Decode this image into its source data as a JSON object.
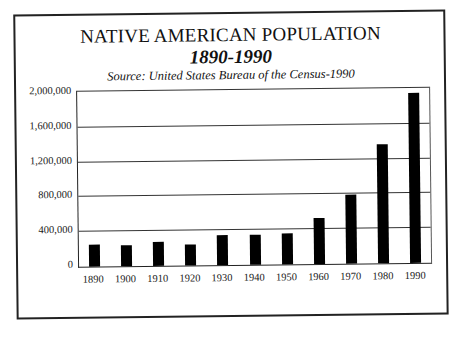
{
  "chart_data": {
    "type": "bar",
    "title": "NATIVE AMERICAN POPULATION",
    "subtitle": "1890-1990",
    "source": "Source: United States Bureau of the Census-1990",
    "xlabel": "",
    "ylabel": "",
    "categories": [
      "1890",
      "1900",
      "1910",
      "1920",
      "1930",
      "1940",
      "1950",
      "1960",
      "1970",
      "1980",
      "1990"
    ],
    "values": [
      248000,
      237000,
      277000,
      244000,
      343000,
      345000,
      357000,
      524000,
      793000,
      1364000,
      1959000
    ],
    "ylim": [
      0,
      2000000
    ],
    "yticks": [
      0,
      400000,
      800000,
      1200000,
      1600000,
      2000000
    ],
    "ytick_labels": [
      "0",
      "400,000",
      "800,000",
      "1,200,000",
      "1,600,000",
      "2,000,000"
    ],
    "grid": true,
    "legend": null,
    "bar_color": "#000000"
  },
  "header": {
    "title": "NATIVE AMERICAN POPULATION",
    "subtitle": "1890-1990",
    "source": "Source: United States Bureau of the Census-1990"
  }
}
